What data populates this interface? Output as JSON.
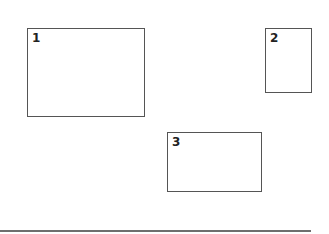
{
  "diagram": {
    "boxes": [
      {
        "label": "1",
        "x": 27,
        "y": 28,
        "w": 118,
        "h": 89
      },
      {
        "label": "2",
        "x": 265,
        "y": 28,
        "w": 47,
        "h": 65
      },
      {
        "label": "3",
        "x": 167,
        "y": 132,
        "w": 95,
        "h": 60
      }
    ],
    "baseline": {
      "y": 230,
      "x_end": 311
    },
    "colors": {
      "border": "#555555",
      "baseline": "#6e6e6e",
      "text": "#222222"
    }
  }
}
